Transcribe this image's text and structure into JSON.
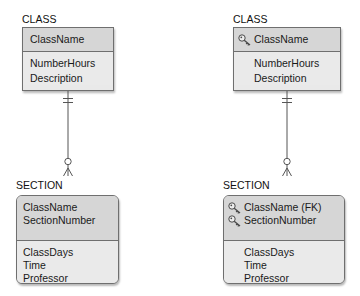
{
  "diagrams": [
    {
      "side": "left",
      "parent": {
        "name": "CLASS",
        "key_attributes": [
          {
            "name": "ClassName",
            "key_icon": false
          }
        ],
        "attributes": [
          "NumberHours",
          "Description"
        ],
        "shape": "rectangle"
      },
      "child": {
        "name": "SECTION",
        "key_attributes": [
          {
            "name": "ClassName",
            "key_icon": false
          },
          {
            "name": "SectionNumber",
            "key_icon": false
          }
        ],
        "attributes": [
          "ClassDays",
          "Time",
          "Professor"
        ],
        "shape": "rounded-rectangle"
      },
      "relationship": {
        "parent_end": "mandatory-one",
        "child_end": "optional-many"
      }
    },
    {
      "side": "right",
      "parent": {
        "name": "CLASS",
        "key_attributes": [
          {
            "name": "ClassName",
            "key_icon": true
          }
        ],
        "attributes": [
          "NumberHours",
          "Description"
        ],
        "shape": "rectangle"
      },
      "child": {
        "name": "SECTION",
        "key_attributes": [
          {
            "name": "ClassName (FK)",
            "key_icon": true
          },
          {
            "name": "SectionNumber",
            "key_icon": true
          }
        ],
        "attributes": [
          "ClassDays",
          "Time",
          "Professor"
        ],
        "shape": "rounded-rectangle"
      },
      "relationship": {
        "parent_end": "mandatory-one",
        "child_end": "optional-many"
      }
    }
  ],
  "colors": {
    "key_section": "#d6d6d6",
    "attribute_section": "#eaeaea",
    "border": "#6f6f6f",
    "connector": "#555555"
  }
}
